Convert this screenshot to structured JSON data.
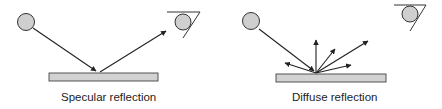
{
  "panels": [
    {
      "id": "specular",
      "caption": "Specular reflection",
      "elements": [
        "light-source",
        "incident-ray",
        "reflective-surface",
        "reflected-ray",
        "eye"
      ]
    },
    {
      "id": "diffuse",
      "caption": "Diffuse reflection",
      "elements": [
        "light-source",
        "incident-ray",
        "reflective-surface",
        "scattered-rays",
        "eye"
      ]
    }
  ],
  "colors": {
    "surface_fill": "#d2d2d2",
    "source_fill": "#cfcfcf",
    "stroke": "#222222"
  }
}
